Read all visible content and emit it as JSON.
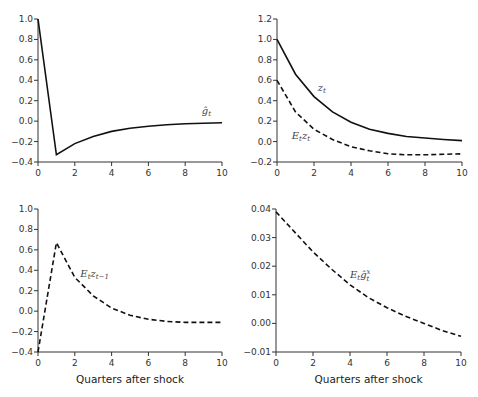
{
  "chart_data": [
    {
      "id": "top-left",
      "type": "line",
      "title": "",
      "xlabel": "",
      "ylabel": "",
      "x": [
        0,
        1,
        2,
        3,
        4,
        5,
        6,
        7,
        8,
        9,
        10
      ],
      "xlim": [
        0,
        10
      ],
      "ylim": [
        -0.4,
        1.0
      ],
      "xticks": [
        0,
        2,
        4,
        6,
        8,
        10
      ],
      "xtick_labels": [
        "0",
        "2",
        "4",
        "6",
        "8",
        "10"
      ],
      "yticks": [
        -0.4,
        -0.2,
        0.0,
        0.2,
        0.4,
        0.6,
        0.8,
        1.0
      ],
      "ytick_labels": [
        "−0.4",
        "−0.2",
        "0.0",
        "0.2",
        "0.4",
        "0.6",
        "0.8",
        "1.0"
      ],
      "grid": false,
      "series": [
        {
          "name": "ĝ_t",
          "label_main": "ĝ",
          "label_sub": "t",
          "label_sup": "",
          "label_at": [
            8.9,
            0.07
          ],
          "style": "solid",
          "values": [
            1.0,
            -0.33,
            -0.22,
            -0.15,
            -0.1,
            -0.07,
            -0.05,
            -0.035,
            -0.025,
            -0.02,
            -0.015
          ]
        }
      ]
    },
    {
      "id": "top-right",
      "type": "line",
      "title": "",
      "xlabel": "",
      "ylabel": "",
      "x": [
        0,
        1,
        2,
        3,
        4,
        5,
        6,
        7,
        8,
        9,
        10
      ],
      "xlim": [
        0,
        10
      ],
      "ylim": [
        -0.2,
        1.2
      ],
      "xticks": [
        0,
        2,
        4,
        6,
        8,
        10
      ],
      "xtick_labels": [
        "0",
        "2",
        "4",
        "6",
        "8",
        "10"
      ],
      "yticks": [
        -0.2,
        0.0,
        0.2,
        0.4,
        0.6,
        0.8,
        1.0,
        1.2
      ],
      "ytick_labels": [
        "−0.2",
        "0.0",
        "0.2",
        "0.4",
        "0.6",
        "0.8",
        "1.0",
        "1.2"
      ],
      "grid": false,
      "series": [
        {
          "name": "z_t",
          "label_main": "z",
          "label_sub": "t",
          "label_sup": "",
          "label_at": [
            2.2,
            0.5
          ],
          "style": "solid",
          "values": [
            1.0,
            0.66,
            0.44,
            0.29,
            0.19,
            0.12,
            0.08,
            0.05,
            0.035,
            0.02,
            0.01
          ]
        },
        {
          "name": "E_t z_t",
          "label_main": "E",
          "label_sub": "t",
          "label_main2": "z",
          "label_sub2": "t",
          "label_sup": "",
          "label_at": [
            0.8,
            0.03
          ],
          "style": "dashed",
          "values": [
            0.6,
            0.29,
            0.12,
            0.02,
            -0.05,
            -0.09,
            -0.12,
            -0.13,
            -0.13,
            -0.125,
            -0.12
          ]
        }
      ]
    },
    {
      "id": "bottom-left",
      "type": "line",
      "title": "",
      "xlabel": "Quarters after shock",
      "ylabel": "",
      "x": [
        0,
        1,
        2,
        3,
        4,
        5,
        6,
        7,
        8,
        9,
        10
      ],
      "xlim": [
        0,
        10
      ],
      "ylim": [
        -0.4,
        1.0
      ],
      "xticks": [
        0,
        2,
        4,
        6,
        8,
        10
      ],
      "xtick_labels": [
        "0",
        "2",
        "4",
        "6",
        "8",
        "10"
      ],
      "yticks": [
        -0.4,
        -0.2,
        0.0,
        0.2,
        0.4,
        0.6,
        0.8,
        1.0
      ],
      "ytick_labels": [
        "−0.4",
        "−0.2",
        "0.0",
        "0.2",
        "0.4",
        "0.6",
        "0.8",
        "1.0"
      ],
      "grid": false,
      "series": [
        {
          "name": "E_t z_{t-1}",
          "label_main": "E",
          "label_sub": "t",
          "label_main2": "z",
          "label_sub2": "t−1",
          "label_sup": "",
          "label_at": [
            2.3,
            0.33
          ],
          "style": "dashed",
          "values": [
            -0.4,
            0.67,
            0.33,
            0.15,
            0.03,
            -0.04,
            -0.08,
            -0.1,
            -0.11,
            -0.11,
            -0.11
          ]
        }
      ]
    },
    {
      "id": "bottom-right",
      "type": "line",
      "title": "",
      "xlabel": "Quarters after shock",
      "ylabel": "",
      "x": [
        0,
        1,
        2,
        3,
        4,
        5,
        6,
        7,
        8,
        9,
        10
      ],
      "xlim": [
        0,
        10
      ],
      "ylim": [
        -0.01,
        0.04
      ],
      "xticks": [
        0,
        2,
        4,
        6,
        8,
        10
      ],
      "xtick_labels": [
        "0",
        "2",
        "4",
        "6",
        "8",
        "10"
      ],
      "yticks": [
        -0.01,
        0.0,
        0.01,
        0.02,
        0.03,
        0.04
      ],
      "ytick_labels": [
        "−0.01",
        "0.00",
        "0.01",
        "0.02",
        "0.03",
        "0.04"
      ],
      "grid": false,
      "series": [
        {
          "name": "E_t ĝ_t^x",
          "label_main": "E",
          "label_sub": "t",
          "label_main2": "ĝ",
          "label_sub2": "t",
          "label_sup": "x",
          "label_at": [
            4.0,
            0.016
          ],
          "style": "dashed",
          "values": [
            0.039,
            0.032,
            0.025,
            0.019,
            0.0135,
            0.009,
            0.0055,
            0.0025,
            0.0,
            -0.0025,
            -0.0045
          ]
        }
      ]
    }
  ]
}
